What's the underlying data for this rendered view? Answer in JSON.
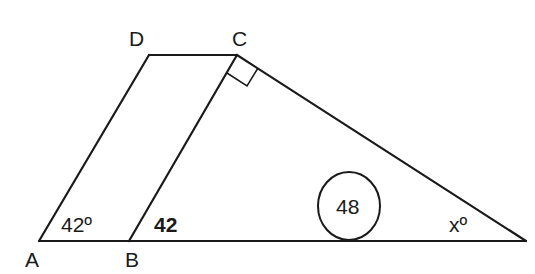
{
  "diagram": {
    "type": "geometry",
    "points": {
      "A": {
        "label": "A",
        "x": 39,
        "y": 241
      },
      "B": {
        "label": "B",
        "x": 129,
        "y": 241
      },
      "C": {
        "label": "C",
        "x": 237,
        "y": 55
      },
      "D": {
        "label": "D",
        "x": 149,
        "y": 55
      },
      "E": {
        "x": 526,
        "y": 241
      }
    },
    "segments": [
      "A-B",
      "B-E",
      "A-D",
      "D-C",
      "B-C",
      "C-E"
    ],
    "right_angle_at": "C",
    "annotations": {
      "angle_A": "42º",
      "segment_AB_region": "42",
      "circled_value": "48",
      "angle_E": "xº"
    },
    "colors": {
      "stroke": "#1a1a1a",
      "background": "#ffffff"
    }
  }
}
